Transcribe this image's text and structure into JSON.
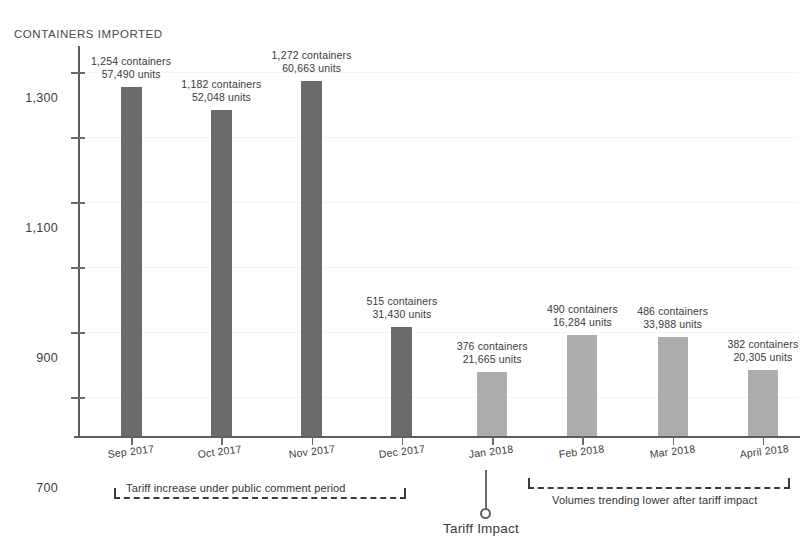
{
  "chart_data": {
    "type": "bar",
    "title": "",
    "ylabel": "CONTAINERS IMPORTED",
    "xlabel": "",
    "categories": [
      "Sep 2017",
      "Oct 2017",
      "Nov 2017",
      "Dec 2017",
      "Jan 2018",
      "Feb 2018",
      "Mar 2018",
      "April 2018"
    ],
    "values": [
      1254,
      1182,
      1272,
      515,
      376,
      490,
      486,
      382
    ],
    "units": [
      57490,
      52048,
      60663,
      31430,
      21665,
      16284,
      33988,
      20305
    ],
    "point_labels": [
      "1,254 containers\n57,490 units",
      "1,182 containers\n52,048 units",
      "1,272 containers\n60,663 units",
      "515 containers\n31,430 units",
      "376 containers\n21,665 units",
      "490 containers\n16,284 units",
      "486 containers\n33,988 units",
      "382 containers\n20,305 units"
    ],
    "series_groups": [
      {
        "name": "pre-tariff",
        "color": "#6b6b6b",
        "categories": [
          "Sep 2017",
          "Oct 2017",
          "Nov 2017",
          "Dec 2017"
        ]
      },
      {
        "name": "post-tariff",
        "color": "#adadad",
        "categories": [
          "Jan 2018",
          "Feb 2018",
          "Mar 2018",
          "April 2018"
        ]
      }
    ],
    "ytick_labels": [
      "300",
      "500",
      "700",
      "900",
      "1,100",
      "1,300"
    ],
    "ytick_values": [
      300,
      500,
      700,
      900,
      1100,
      1300
    ],
    "ylim": [
      180,
      1380
    ],
    "grid": false,
    "legend": "none",
    "annotations": [
      "Tariff increase under public comment period",
      "Tariff Impact",
      "Volumes trending lower after tariff impact"
    ]
  },
  "axis": {
    "y_title": "CONTAINERS IMPORTED",
    "ticks": [
      {
        "label": "1,300",
        "value": 1300
      },
      {
        "label": "1,100",
        "value": 1100
      },
      {
        "label": "900",
        "value": 900
      },
      {
        "label": "700",
        "value": 700
      },
      {
        "label": "500",
        "value": 500
      },
      {
        "label": "300",
        "value": 300
      }
    ]
  },
  "bars": [
    {
      "category": "Sep 2017",
      "containers": "1,254 containers",
      "units": "57,490 units",
      "value": 1254,
      "tone": "dark"
    },
    {
      "category": "Oct 2017",
      "containers": "1,182 containers",
      "units": "52,048 units",
      "value": 1182,
      "tone": "dark"
    },
    {
      "category": "Nov 2017",
      "containers": "1,272 containers",
      "units": "60,663 units",
      "value": 1272,
      "tone": "dark"
    },
    {
      "category": "Dec 2017",
      "containers": "515 containers",
      "units": "31,430 units",
      "value": 515,
      "tone": "dark"
    },
    {
      "category": "Jan 2018",
      "containers": "376 containers",
      "units": "21,665 units",
      "value": 376,
      "tone": "light"
    },
    {
      "category": "Feb 2018",
      "containers": "490 containers",
      "units": "16,284 units",
      "value": 490,
      "tone": "light"
    },
    {
      "category": "Mar 2018",
      "containers": "486 containers",
      "units": "33,988 units",
      "value": 486,
      "tone": "light"
    },
    {
      "category": "April 2018",
      "containers": "382 containers",
      "units": "20,305 units",
      "value": 382,
      "tone": "light"
    }
  ],
  "annotations": {
    "left_bracket_text": "Tariff increase under public comment period",
    "right_bracket_text": "Volumes trending lower after tariff impact",
    "impact_marker_label": "Tariff Impact"
  },
  "colors": {
    "bar_dark": "#6b6b6b",
    "bar_light": "#adadad",
    "axis": "#5d5d5d",
    "text": "#3a3a3a"
  }
}
